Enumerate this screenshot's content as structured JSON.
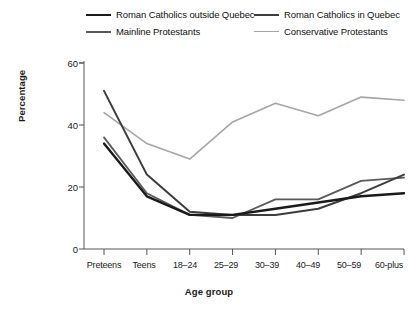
{
  "chart_data": {
    "type": "line",
    "title": "",
    "xlabel": "Age group",
    "ylabel": "Percentage",
    "categories": [
      "Preteens",
      "Teens",
      "18–24",
      "25–29",
      "30–39",
      "40–49",
      "50–59",
      "60-plus"
    ],
    "ylim": [
      0,
      60
    ],
    "yticks": [
      0,
      20,
      40,
      60
    ],
    "grid": false,
    "legend_position": "top",
    "series": [
      {
        "name": "Roman Catholics outside Quebec",
        "color": "#1a1a1a",
        "values": [
          34,
          17,
          11,
          11,
          13,
          15,
          17,
          18
        ]
      },
      {
        "name": "Roman Catholics in Quebec",
        "color": "#3d3d3d",
        "values": [
          51,
          24,
          12,
          11,
          11,
          13,
          18,
          24
        ]
      },
      {
        "name": "Mainline Protestants",
        "color": "#5a5a5a",
        "values": [
          36,
          18,
          11,
          10,
          16,
          16,
          22,
          23
        ]
      },
      {
        "name": "Conservative Protestants",
        "color": "#a6a6a6",
        "values": [
          44,
          34,
          29,
          41,
          47,
          43,
          49,
          48
        ]
      }
    ]
  },
  "legend": {
    "entries": [
      {
        "label": "Roman Catholics outside Quebec",
        "color": "#1a1a1a"
      },
      {
        "label": "Roman Catholics in Quebec",
        "color": "#3d3d3d"
      },
      {
        "label": "Mainline Protestants",
        "color": "#5a5a5a"
      },
      {
        "label": "Conservative Protestants",
        "color": "#a6a6a6"
      }
    ]
  },
  "axes": {
    "y_title": "Percentage",
    "x_title": "Age group",
    "y_tick_labels": [
      "60",
      "40",
      "20",
      "0"
    ],
    "x_tick_labels": [
      "Preteens",
      "Teens",
      "18–24",
      "25–29",
      "30–39",
      "40–49",
      "50–59",
      "60-plus"
    ],
    "axis_color": "#555555"
  }
}
